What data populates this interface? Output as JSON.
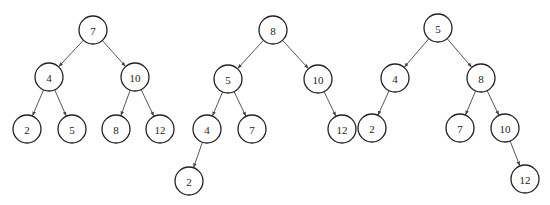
{
  "diagram": {
    "type": "binary-search-trees",
    "node_radius": 14,
    "colors": {
      "stroke": "#222222",
      "fill": "#ffffff",
      "edge": "#444444"
    },
    "trees": [
      {
        "name": "tree-1",
        "nodes": [
          {
            "id": "a7",
            "label": "7",
            "x": 93,
            "y": 30
          },
          {
            "id": "a4",
            "label": "4",
            "x": 49,
            "y": 77
          },
          {
            "id": "a10",
            "label": "10",
            "x": 135,
            "y": 77
          },
          {
            "id": "a2",
            "label": "2",
            "x": 27,
            "y": 129
          },
          {
            "id": "a5",
            "label": "5",
            "x": 72,
            "y": 129
          },
          {
            "id": "a8",
            "label": "8",
            "x": 116,
            "y": 129
          },
          {
            "id": "a12",
            "label": "12",
            "x": 160,
            "y": 129
          }
        ],
        "edges": [
          [
            "a7",
            "a4"
          ],
          [
            "a7",
            "a10"
          ],
          [
            "a4",
            "a2"
          ],
          [
            "a4",
            "a5"
          ],
          [
            "a10",
            "a8"
          ],
          [
            "a10",
            "a12"
          ]
        ]
      },
      {
        "name": "tree-2",
        "nodes": [
          {
            "id": "b8",
            "label": "8",
            "x": 273,
            "y": 30
          },
          {
            "id": "b5",
            "label": "5",
            "x": 228,
            "y": 79
          },
          {
            "id": "b10",
            "label": "10",
            "x": 318,
            "y": 79
          },
          {
            "id": "b4",
            "label": "4",
            "x": 207,
            "y": 129
          },
          {
            "id": "b7",
            "label": "7",
            "x": 252,
            "y": 129
          },
          {
            "id": "b12",
            "label": "12",
            "x": 342,
            "y": 129
          },
          {
            "id": "b2",
            "label": "2",
            "x": 189,
            "y": 181
          }
        ],
        "edges": [
          [
            "b8",
            "b5"
          ],
          [
            "b8",
            "b10"
          ],
          [
            "b5",
            "b4"
          ],
          [
            "b5",
            "b7"
          ],
          [
            "b10",
            "b12"
          ],
          [
            "b4",
            "b2"
          ]
        ]
      },
      {
        "name": "tree-3",
        "nodes": [
          {
            "id": "c5",
            "label": "5",
            "x": 438,
            "y": 28
          },
          {
            "id": "c4",
            "label": "4",
            "x": 395,
            "y": 78
          },
          {
            "id": "c8",
            "label": "8",
            "x": 481,
            "y": 78
          },
          {
            "id": "c2",
            "label": "2",
            "x": 372,
            "y": 128
          },
          {
            "id": "c7",
            "label": "7",
            "x": 460,
            "y": 128
          },
          {
            "id": "c10",
            "label": "10",
            "x": 505,
            "y": 128
          },
          {
            "id": "c12",
            "label": "12",
            "x": 525,
            "y": 179
          }
        ],
        "edges": [
          [
            "c5",
            "c4"
          ],
          [
            "c5",
            "c8"
          ],
          [
            "c4",
            "c2"
          ],
          [
            "c8",
            "c7"
          ],
          [
            "c8",
            "c10"
          ],
          [
            "c10",
            "c12"
          ]
        ]
      }
    ]
  }
}
